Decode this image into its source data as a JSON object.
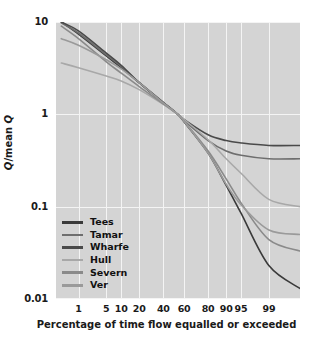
{
  "chart_data": {
    "type": "line",
    "title": "",
    "xlabel": "Percentage of time flow equalled or exceeded",
    "ylabel": "Q/mean Q",
    "yscale": "log",
    "xscale": "probability",
    "ylim": [
      0.01,
      10
    ],
    "xlim": [
      0.2,
      99.9
    ],
    "grid": true,
    "legend_position": "lower-left-inside",
    "ytick_labels": [
      "10",
      "1",
      "0.1",
      "0.01"
    ],
    "ytick_values": [
      10,
      1,
      0.1,
      0.01
    ],
    "xtick_labels": [
      "1",
      "5",
      "10",
      "20",
      "40",
      "60",
      "80",
      "90",
      "95",
      "99"
    ],
    "xtick_values": [
      1,
      5,
      10,
      20,
      40,
      60,
      80,
      90,
      95,
      99
    ],
    "series": [
      {
        "name": "Tees",
        "color": "#3a3a3a",
        "x": [
          0.3,
          1,
          5,
          10,
          20,
          40,
          54,
          60,
          80,
          90,
          95,
          99,
          99.9
        ],
        "values": [
          10.0,
          7.4,
          4.3,
          3.2,
          2.2,
          1.35,
          1.0,
          0.83,
          0.38,
          0.17,
          0.085,
          0.023,
          0.013
        ]
      },
      {
        "name": "Tamar",
        "color": "#6e6e6e",
        "x": [
          0.3,
          1,
          5,
          10,
          20,
          40,
          54,
          60,
          80,
          90,
          95,
          99,
          99.9
        ],
        "values": [
          9.8,
          7.6,
          4.4,
          3.3,
          2.2,
          1.34,
          1.0,
          0.86,
          0.52,
          0.4,
          0.36,
          0.33,
          0.33
        ]
      },
      {
        "name": "Wharfe",
        "color": "#4a4a4a",
        "x": [
          0.3,
          1,
          5,
          10,
          20,
          40,
          54,
          60,
          80,
          90,
          95,
          99,
          99.9
        ],
        "values": [
          10.0,
          8.0,
          4.6,
          3.4,
          2.2,
          1.33,
          1.0,
          0.88,
          0.6,
          0.52,
          0.49,
          0.46,
          0.46
        ]
      },
      {
        "name": "Hull",
        "color": "#a8a8a8",
        "x": [
          0.3,
          1,
          5,
          10,
          20,
          40,
          54,
          60,
          80,
          90,
          95,
          99,
          99.9
        ],
        "values": [
          3.6,
          3.2,
          2.6,
          2.3,
          1.85,
          1.28,
          1.0,
          0.88,
          0.53,
          0.33,
          0.23,
          0.12,
          0.1
        ]
      },
      {
        "name": "Severn",
        "color": "#8a8a8a",
        "x": [
          0.3,
          1,
          5,
          10,
          20,
          40,
          54,
          60,
          80,
          90,
          95,
          99,
          99.9
        ],
        "values": [
          9.0,
          6.6,
          3.7,
          2.8,
          2.0,
          1.3,
          1.0,
          0.84,
          0.4,
          0.2,
          0.11,
          0.044,
          0.033
        ]
      },
      {
        "name": "Ver",
        "color": "#9a9a9a",
        "x": [
          0.3,
          1,
          5,
          10,
          20,
          40,
          54,
          60,
          80,
          90,
          95,
          99,
          99.9
        ],
        "values": [
          6.6,
          5.6,
          3.9,
          3.1,
          2.2,
          1.33,
          1.0,
          0.84,
          0.38,
          0.175,
          0.105,
          0.056,
          0.05
        ]
      }
    ]
  },
  "axis": {
    "y_label_text": "Q/mean Q",
    "x_label_text": "Percentage of time flow equalled or exceeded"
  },
  "legend": {
    "items": [
      {
        "label": "Tees",
        "color": "#3a3a3a"
      },
      {
        "label": "Tamar",
        "color": "#6e6e6e"
      },
      {
        "label": "Wharfe",
        "color": "#4a4a4a"
      },
      {
        "label": "Hull",
        "color": "#a8a8a8"
      },
      {
        "label": "Severn",
        "color": "#8a8a8a"
      },
      {
        "label": "Ver",
        "color": "#9a9a9a"
      }
    ]
  },
  "colors": {
    "plot_background": "#d4d4d4",
    "gridline": "#f4f4f4",
    "page_background": "#ffffff",
    "text": "#1a1a1a"
  }
}
